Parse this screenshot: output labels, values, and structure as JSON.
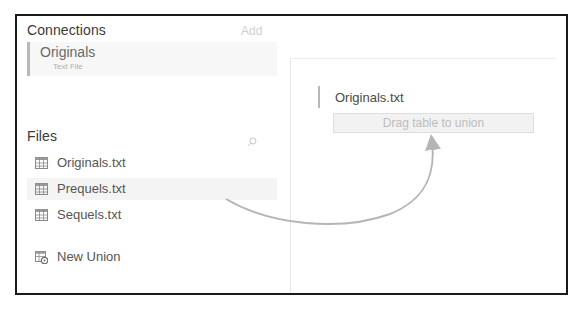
{
  "connections": {
    "title": "Connections",
    "add_label": "Add",
    "items": [
      {
        "name": "Originals",
        "type": "Text File"
      }
    ]
  },
  "files": {
    "title": "Files",
    "search_icon": "search-icon",
    "items": [
      {
        "label": "Originals.txt",
        "icon": "table-icon",
        "highlighted": false
      },
      {
        "label": "Prequels.txt",
        "icon": "table-icon",
        "highlighted": true
      },
      {
        "label": "Sequels.txt",
        "icon": "table-icon",
        "highlighted": false
      }
    ],
    "new_union": {
      "label": "New Union",
      "icon": "new-union-icon"
    }
  },
  "canvas": {
    "table_label": "Originals.txt",
    "drop_zone_label": "Drag table to union"
  },
  "annotation": {
    "arrow": "curved-arrow from Prequels.txt to drop zone",
    "color": "#b5b5b5"
  }
}
